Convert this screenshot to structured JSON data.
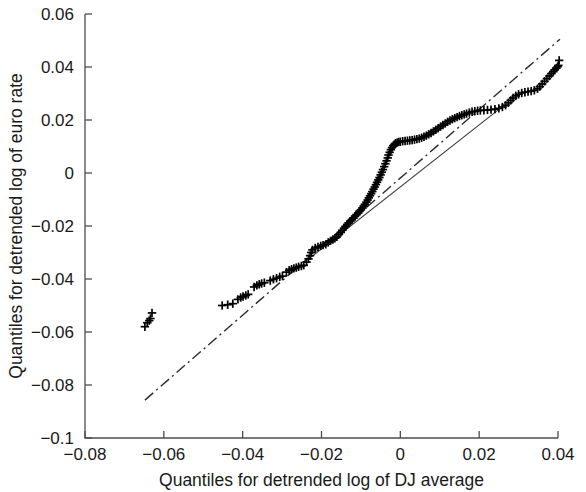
{
  "chart_data": {
    "type": "scatter",
    "title": "",
    "subtitle": "",
    "xlabel": "Quantiles for detrended log of DJ average",
    "ylabel": "Quantiles for detrended log of euro rate",
    "xlim": [
      -0.08,
      0.04
    ],
    "ylim": [
      -0.1,
      0.06
    ],
    "xticks": [
      -0.08,
      -0.06,
      -0.04,
      -0.02,
      0,
      0.02,
      0.04
    ],
    "xtick_labels": [
      "−0.08",
      "−0.06",
      "−0.04",
      "−0.02",
      "0",
      "0.02",
      "0.04"
    ],
    "yticks": [
      -0.1,
      -0.08,
      -0.06,
      -0.04,
      -0.02,
      0,
      0.02,
      0.04,
      0.06
    ],
    "ytick_labels": [
      "−0.1",
      "−0.08",
      "−0.06",
      "−0.04",
      "−0.02",
      "0",
      "0.02",
      "0.04",
      "0.06"
    ],
    "grid": false,
    "legend": null,
    "legend_position": "none",
    "marker_symbol": "plus",
    "marker_color": "#000000",
    "series": [
      {
        "name": "qq-points",
        "marker": "+",
        "points": [
          [
            -0.0648,
            -0.058
          ],
          [
            -0.0642,
            -0.0565
          ],
          [
            -0.0637,
            -0.0557
          ],
          [
            -0.0634,
            -0.0549
          ],
          [
            -0.063,
            -0.0528
          ],
          [
            -0.0452,
            -0.05
          ],
          [
            -0.0438,
            -0.0497
          ],
          [
            -0.0425,
            -0.0493
          ],
          [
            -0.0412,
            -0.0477
          ],
          [
            -0.0405,
            -0.047
          ],
          [
            -0.0399,
            -0.0466
          ],
          [
            -0.0392,
            -0.0462
          ],
          [
            -0.0386,
            -0.0458
          ],
          [
            -0.0371,
            -0.043
          ],
          [
            -0.0364,
            -0.0424
          ],
          [
            -0.0358,
            -0.042
          ],
          [
            -0.0352,
            -0.0417
          ],
          [
            -0.0345,
            -0.0414
          ],
          [
            -0.033,
            -0.0406
          ],
          [
            -0.0322,
            -0.0401
          ],
          [
            -0.0314,
            -0.0397
          ],
          [
            -0.0306,
            -0.0392
          ],
          [
            -0.0299,
            -0.0389
          ],
          [
            -0.0289,
            -0.0374
          ],
          [
            -0.0282,
            -0.0367
          ],
          [
            -0.0276,
            -0.0363
          ],
          [
            -0.027,
            -0.036
          ],
          [
            -0.0264,
            -0.0357
          ],
          [
            -0.0258,
            -0.0354
          ],
          [
            -0.0251,
            -0.0351
          ],
          [
            -0.0245,
            -0.0348
          ],
          [
            -0.0238,
            -0.0336
          ],
          [
            -0.0233,
            -0.0324
          ],
          [
            -0.0229,
            -0.0312
          ],
          [
            -0.0226,
            -0.03
          ],
          [
            -0.0223,
            -0.029
          ],
          [
            -0.0216,
            -0.0283
          ],
          [
            -0.0209,
            -0.0279
          ],
          [
            -0.0202,
            -0.0275
          ],
          [
            -0.0196,
            -0.0272
          ],
          [
            -0.0189,
            -0.0269
          ],
          [
            -0.0183,
            -0.0262
          ],
          [
            -0.0177,
            -0.0256
          ],
          [
            -0.0171,
            -0.0251
          ],
          [
            -0.0166,
            -0.0246
          ],
          [
            -0.0161,
            -0.0241
          ],
          [
            -0.0156,
            -0.0232
          ],
          [
            -0.0151,
            -0.0224
          ],
          [
            -0.0147,
            -0.0216
          ],
          [
            -0.0143,
            -0.0208
          ],
          [
            -0.0139,
            -0.0201
          ],
          [
            -0.0135,
            -0.0194
          ],
          [
            -0.0131,
            -0.0188
          ],
          [
            -0.0127,
            -0.0182
          ],
          [
            -0.0123,
            -0.0176
          ],
          [
            -0.0119,
            -0.017
          ],
          [
            -0.0115,
            -0.0163
          ],
          [
            -0.0111,
            -0.0157
          ],
          [
            -0.0107,
            -0.0151
          ],
          [
            -0.0104,
            -0.0145
          ],
          [
            -0.01,
            -0.0139
          ],
          [
            -0.0096,
            -0.0132
          ],
          [
            -0.0093,
            -0.0125
          ],
          [
            -0.009,
            -0.0118
          ],
          [
            -0.0086,
            -0.011
          ],
          [
            -0.0083,
            -0.0102
          ],
          [
            -0.008,
            -0.0094
          ],
          [
            -0.0077,
            -0.0086
          ],
          [
            -0.0074,
            -0.0078
          ],
          [
            -0.0071,
            -0.007
          ],
          [
            -0.0068,
            -0.0061
          ],
          [
            -0.0065,
            -0.0053
          ],
          [
            -0.0062,
            -0.0044
          ],
          [
            -0.0059,
            -0.0035
          ],
          [
            -0.0056,
            -0.0026
          ],
          [
            -0.0053,
            -0.0017
          ],
          [
            -0.005,
            -0.0007
          ],
          [
            -0.0047,
            0.0003
          ],
          [
            -0.0044,
            0.0013
          ],
          [
            -0.0041,
            0.0024
          ],
          [
            -0.0038,
            0.0035
          ],
          [
            -0.0035,
            0.0046
          ],
          [
            -0.0032,
            0.0057
          ],
          [
            -0.003,
            0.0068
          ],
          [
            -0.0027,
            0.0078
          ],
          [
            -0.0024,
            0.0088
          ],
          [
            -0.0021,
            0.0096
          ],
          [
            -0.0018,
            0.0103
          ],
          [
            -0.0015,
            0.0108
          ],
          [
            -0.0012,
            0.0112
          ],
          [
            -0.0008,
            0.0115
          ],
          [
            -0.0004,
            0.0117
          ],
          [
            0.0,
            0.0118
          ],
          [
            0.0006,
            0.012
          ],
          [
            0.0012,
            0.0121
          ],
          [
            0.0018,
            0.0122
          ],
          [
            0.0024,
            0.0123
          ],
          [
            0.003,
            0.0124
          ],
          [
            0.0036,
            0.0126
          ],
          [
            0.0042,
            0.0128
          ],
          [
            0.0048,
            0.013
          ],
          [
            0.0054,
            0.0133
          ],
          [
            0.006,
            0.0137
          ],
          [
            0.0066,
            0.0141
          ],
          [
            0.0072,
            0.0146
          ],
          [
            0.0078,
            0.0151
          ],
          [
            0.0084,
            0.0157
          ],
          [
            0.009,
            0.0163
          ],
          [
            0.0096,
            0.0169
          ],
          [
            0.0102,
            0.0175
          ],
          [
            0.0108,
            0.0181
          ],
          [
            0.0114,
            0.0187
          ],
          [
            0.012,
            0.0193
          ],
          [
            0.0126,
            0.0198
          ],
          [
            0.0132,
            0.0203
          ],
          [
            0.0138,
            0.0207
          ],
          [
            0.0144,
            0.0211
          ],
          [
            0.015,
            0.0215
          ],
          [
            0.0156,
            0.0218
          ],
          [
            0.0162,
            0.0221
          ],
          [
            0.0168,
            0.0224
          ],
          [
            0.0175,
            0.0228
          ],
          [
            0.0182,
            0.0231
          ],
          [
            0.0189,
            0.0233
          ],
          [
            0.0196,
            0.0235
          ],
          [
            0.0203,
            0.0236
          ],
          [
            0.0212,
            0.0237
          ],
          [
            0.0221,
            0.0238
          ],
          [
            0.023,
            0.0239
          ],
          [
            0.024,
            0.0241
          ],
          [
            0.025,
            0.0244
          ],
          [
            0.0259,
            0.0249
          ],
          [
            0.0267,
            0.0256
          ],
          [
            0.0274,
            0.0265
          ],
          [
            0.028,
            0.0274
          ],
          [
            0.0286,
            0.0283
          ],
          [
            0.0293,
            0.0291
          ],
          [
            0.03,
            0.0297
          ],
          [
            0.0308,
            0.0302
          ],
          [
            0.0316,
            0.0305
          ],
          [
            0.0324,
            0.0307
          ],
          [
            0.0332,
            0.0309
          ],
          [
            0.034,
            0.0312
          ],
          [
            0.0348,
            0.0318
          ],
          [
            0.0354,
            0.0326
          ],
          [
            0.036,
            0.0336
          ],
          [
            0.0366,
            0.0346
          ],
          [
            0.0372,
            0.0356
          ],
          [
            0.0378,
            0.0366
          ],
          [
            0.0383,
            0.0375
          ],
          [
            0.0388,
            0.0383
          ],
          [
            0.0392,
            0.039
          ],
          [
            0.0396,
            0.0396
          ],
          [
            0.0399,
            0.0401
          ],
          [
            0.0401,
            0.0406
          ],
          [
            0.0403,
            0.0425
          ]
        ]
      }
    ],
    "reference_lines": [
      {
        "name": "quartile-line",
        "style": "solid",
        "x": [
          -0.0233,
          0.025
        ],
        "y": [
          -0.0325,
          0.024
        ]
      },
      {
        "name": "extrapolated-line",
        "style": "dash-dot",
        "x": [
          -0.0648,
          0.0405
        ],
        "y": [
          -0.0857,
          0.0505
        ]
      }
    ]
  }
}
